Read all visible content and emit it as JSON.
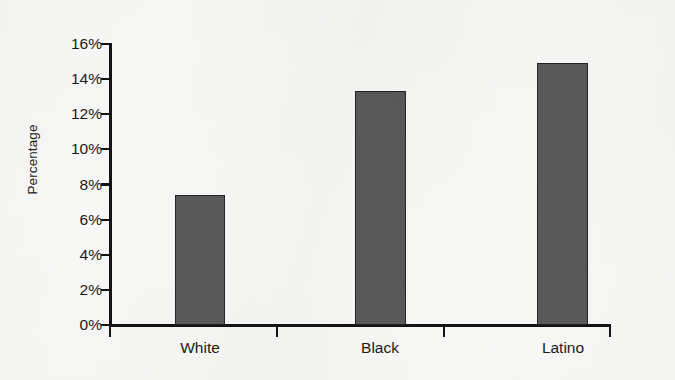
{
  "chart_data": {
    "type": "bar",
    "title": "",
    "xlabel": "",
    "ylabel": "Percentage",
    "categories": [
      "White",
      "Black",
      "Latino"
    ],
    "values": [
      7.4,
      13.3,
      14.9
    ],
    "ylim": [
      0,
      16
    ],
    "ytick_step": 2,
    "ytick_labels": [
      "0%",
      "2%",
      "4%",
      "6%",
      "8%",
      "10%",
      "12%",
      "14%",
      "16%"
    ],
    "ytick_values": [
      0,
      2,
      4,
      6,
      8,
      10,
      12,
      14,
      16
    ],
    "value_format": "percent",
    "grid": false,
    "legend": false,
    "legend_position": "none",
    "series": [
      {
        "name": "Percentage",
        "values": [
          7.4,
          13.3,
          14.9
        ]
      }
    ],
    "colors": {
      "bar_fill": "#595959",
      "bar_border": "#242424",
      "axis": "#141414",
      "text": "#1a1a1a",
      "background": "#f7f7f5"
    }
  }
}
